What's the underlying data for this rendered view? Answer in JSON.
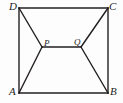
{
  "figure": {
    "type": "geometry-diagram",
    "canvas": {
      "width": 123,
      "height": 103
    },
    "background_color": "#fdfdfd",
    "stroke_color": "#231f20",
    "stroke_width": 1.4,
    "vertices": [
      {
        "id": "A",
        "label": "A",
        "x": 19,
        "y": 93,
        "label_x": 9,
        "label_y": 86
      },
      {
        "id": "B",
        "label": "B",
        "x": 108,
        "y": 93,
        "label_x": 110,
        "label_y": 86
      },
      {
        "id": "C",
        "label": "C",
        "x": 108,
        "y": 8,
        "label_x": 109,
        "label_y": 1
      },
      {
        "id": "D",
        "label": "D",
        "x": 19,
        "y": 8,
        "label_x": 9,
        "label_y": 1
      }
    ],
    "interior_points": [
      {
        "id": "P",
        "label": "P",
        "x": 42,
        "y": 47,
        "label_x": 44,
        "label_y": 39
      },
      {
        "id": "Q",
        "label": "Q",
        "x": 81,
        "y": 47,
        "label_x": 74,
        "label_y": 38
      }
    ],
    "square_path": "M 19 8 L 108 8 L 108 93 L 19 93 Z",
    "segments": [
      {
        "name": "side-DC",
        "from": "D",
        "to": "C",
        "x1": 19,
        "y1": 8,
        "x2": 108,
        "y2": 8
      },
      {
        "name": "side-CB",
        "from": "C",
        "to": "B",
        "x1": 108,
        "y1": 8,
        "x2": 108,
        "y2": 93
      },
      {
        "name": "side-BA",
        "from": "B",
        "to": "A",
        "x1": 108,
        "y1": 93,
        "x2": 19,
        "y2": 93
      },
      {
        "name": "side-AD",
        "from": "A",
        "to": "D",
        "x1": 19,
        "y1": 93,
        "x2": 19,
        "y2": 8
      },
      {
        "name": "segment-DP",
        "from": "D",
        "to": "P",
        "x1": 19,
        "y1": 8,
        "x2": 42,
        "y2": 47
      },
      {
        "name": "segment-AP",
        "from": "A",
        "to": "P",
        "x1": 19,
        "y1": 93,
        "x2": 42,
        "y2": 47
      },
      {
        "name": "segment-CQ",
        "from": "C",
        "to": "Q",
        "x1": 108,
        "y1": 8,
        "x2": 81,
        "y2": 47
      },
      {
        "name": "segment-BQ",
        "from": "B",
        "to": "Q",
        "x1": 108,
        "y1": 93,
        "x2": 81,
        "y2": 47
      },
      {
        "name": "segment-PQ",
        "from": "P",
        "to": "Q",
        "x1": 42,
        "y1": 47,
        "x2": 81,
        "y2": 47
      }
    ]
  }
}
